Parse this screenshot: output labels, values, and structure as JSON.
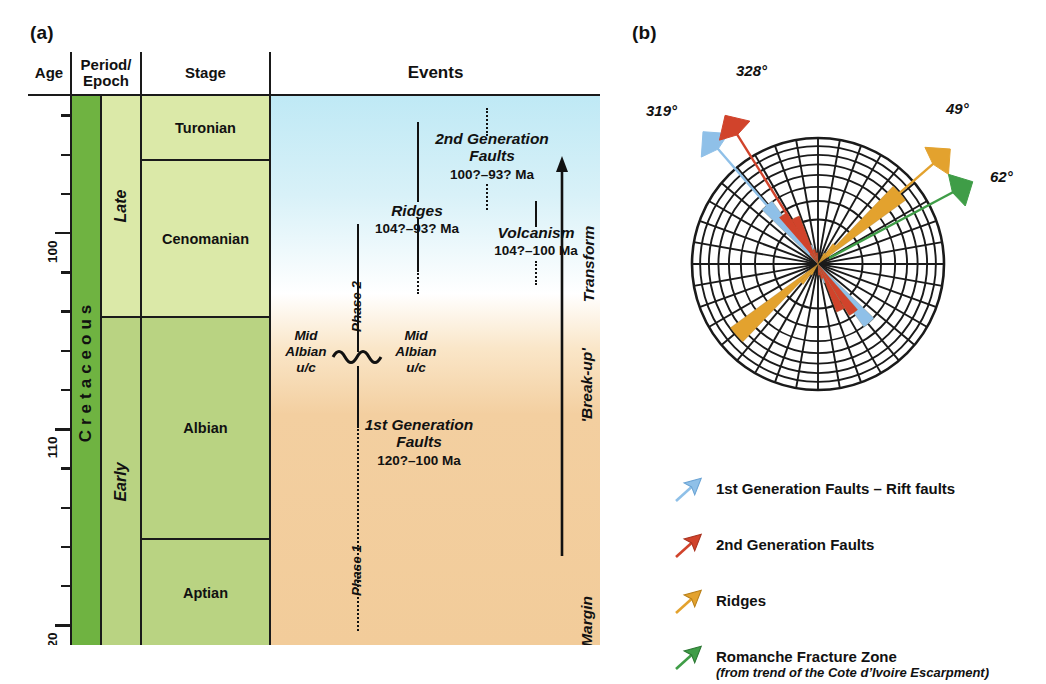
{
  "panels": {
    "a_label": "(a)",
    "b_label": "(b)"
  },
  "chart_a": {
    "headers": {
      "age": "Age",
      "period_epoch": "Period/\nEpoch",
      "stage": "Stage",
      "events": "Events"
    },
    "axis": {
      "unit": "Ma",
      "top_age": 93,
      "bottom_age": 121,
      "major_ticks": [
        100,
        110,
        120
      ],
      "major_labels": [
        "100",
        "110",
        "120"
      ],
      "minor_step": 2
    },
    "period": "Cretaceous",
    "epochs": [
      {
        "label": "Late",
        "top_age": 93,
        "base_age": 100
      },
      {
        "label": "Early",
        "top_age": 100,
        "base_age": 121
      }
    ],
    "stages": [
      {
        "label": "Turonian",
        "top_age": 93,
        "base_age": 96
      },
      {
        "label": "Cenomanian",
        "top_age": 96,
        "base_age": 100
      },
      {
        "label": "Albian",
        "top_age": 100,
        "base_age": 112
      },
      {
        "label": "Aptian",
        "top_age": 112,
        "base_age": 121
      }
    ],
    "events": [
      {
        "name": "2nd Generation\nFaults",
        "title_line1": "2nd Generation",
        "title_line2": "Faults",
        "range": "100?–93? Ma"
      },
      {
        "name": "Ridges",
        "title_line1": "Ridges",
        "title_line2": "",
        "range": "104?–93? Ma"
      },
      {
        "name": "Volcanism",
        "title_line1": "Volcanism",
        "title_line2": "",
        "range": "104?–100 Ma"
      },
      {
        "name": "1st Generation Faults",
        "title_line1": "1st Generation",
        "title_line2": "Faults",
        "range": "120?–100 Ma"
      }
    ],
    "unconformities": [
      {
        "line1": "Mid",
        "line2": "Albian",
        "line3": "u/c"
      },
      {
        "line1": "Mid",
        "line2": "Albian",
        "line3": "u/c"
      }
    ],
    "phases": [
      "Phase 2",
      "Phase 1"
    ],
    "margins": {
      "transform": "Transform\nMargin",
      "transform_l1": "Transform",
      "transform_l2": "Margin",
      "breakup": "'Break-up'",
      "rifted": "Rifted Margin"
    }
  },
  "chart_data": {
    "type": "rose",
    "center_note": "bidirectional rose diagram, equal-area rings",
    "rings": 8,
    "sector_width_deg": 10,
    "colors": {
      "first_gen_faults": "#8fc0e8",
      "second_gen_faults": "#d1432b",
      "ridges": "#e3a22e",
      "romanche": "#3f9d47",
      "grid": "#1a1a1a"
    },
    "arrows": [
      {
        "label": "319°",
        "bearing": 319,
        "color": "#8fc0e8",
        "series": "1st Generation Faults"
      },
      {
        "label": "328°",
        "bearing": 328,
        "color": "#d1432b",
        "series": "2nd Generation Faults"
      },
      {
        "label": "49°",
        "bearing": 49,
        "color": "#e3a22e",
        "series": "Ridges"
      },
      {
        "label": "62°",
        "bearing": 62,
        "color": "#3f9d47",
        "series": "Romanche Fracture Zone"
      }
    ],
    "series": [
      {
        "name": "1st Generation Faults",
        "color": "#8fc0e8",
        "petals": [
          {
            "bearing": 319,
            "length_frac": 0.62
          },
          {
            "bearing": 329,
            "length_frac": 0.34
          },
          {
            "bearing": 339,
            "length_frac": 0.16
          },
          {
            "bearing": 349,
            "length_frac": 0.07
          },
          {
            "bearing": 39,
            "length_frac": 0.1
          }
        ]
      },
      {
        "name": "2nd Generation Faults",
        "color": "#d1432b",
        "petals": [
          {
            "bearing": 324,
            "length_frac": 0.48
          },
          {
            "bearing": 334,
            "length_frac": 0.41
          },
          {
            "bearing": 344,
            "length_frac": 0.12
          },
          {
            "bearing": 354,
            "length_frac": 0.09
          }
        ]
      },
      {
        "name": "Ridges",
        "color": "#e3a22e",
        "petals": [
          {
            "bearing": 49,
            "length_frac": 0.86
          },
          {
            "bearing": 41,
            "length_frac": 0.2
          },
          {
            "bearing": 33,
            "length_frac": 0.1
          }
        ]
      }
    ],
    "legend": [
      {
        "label": "1st Generation Faults – Rift faults",
        "sub": "",
        "color": "#8fc0e8"
      },
      {
        "label": "2nd Generation Faults",
        "sub": "",
        "color": "#d1432b"
      },
      {
        "label": "Ridges",
        "sub": "",
        "color": "#e3a22e"
      },
      {
        "label": "Romanche Fracture Zone",
        "sub": "(from trend of the Cote d’Ivoire Escarpment)",
        "color": "#3f9d47"
      }
    ]
  }
}
